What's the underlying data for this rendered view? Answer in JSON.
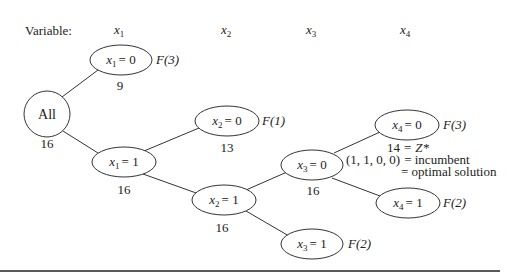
{
  "header": {
    "label": "Variable:",
    "variables": [
      {
        "name": "x",
        "sub": "1"
      },
      {
        "name": "x",
        "sub": "2"
      },
      {
        "name": "x",
        "sub": "3"
      },
      {
        "name": "x",
        "sub": "4"
      }
    ]
  },
  "nodes": {
    "root": {
      "label": "All",
      "bound": "16"
    },
    "x1_0": {
      "var": "x",
      "sub": "1",
      "value": "= 0",
      "bound": "9",
      "fathom": "F(3)"
    },
    "x1_1": {
      "var": "x",
      "sub": "1",
      "value": "= 1",
      "bound": "16"
    },
    "x2_0": {
      "var": "x",
      "sub": "2",
      "value": "= 0",
      "bound": "13",
      "fathom": "F(1)"
    },
    "x2_1": {
      "var": "x",
      "sub": "2",
      "value": "= 1",
      "bound": "16"
    },
    "x3_0": {
      "var": "x",
      "sub": "3",
      "value": "= 0",
      "bound": "16"
    },
    "x3_1": {
      "var": "x",
      "sub": "3",
      "value": "= 1",
      "fathom": "F(2)"
    },
    "x4_0": {
      "var": "x",
      "sub": "4",
      "value": "= 0",
      "fathom": "F(3)"
    },
    "x4_1": {
      "var": "x",
      "sub": "4",
      "value": "= 1",
      "fathom": "F(2)"
    }
  },
  "annotation": {
    "line1_value": "14",
    "line1_eq": "=",
    "line1_z": "Z*",
    "line2_tuple": "(1, 1, 0, 0)",
    "line2_text": "= incumbent",
    "line3_text": "= optimal solution"
  }
}
